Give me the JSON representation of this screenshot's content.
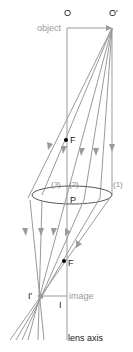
{
  "labels": {
    "object_start": "O",
    "object_end": "O'",
    "object": "object",
    "focal_upper": "F",
    "focal_lower": "F",
    "principal_point": "P",
    "ray1": "(1)",
    "ray2": "(2)",
    "ray3": "(3)",
    "image_start": "I",
    "image_end": "I'",
    "image": "image",
    "lens_axis": "lens axis"
  },
  "colors": {
    "ray": "#9a9a9a",
    "axis": "#9a9a9a",
    "lens": "#555555",
    "dot": "#000000",
    "label_gray": "#9a9a9a"
  }
}
